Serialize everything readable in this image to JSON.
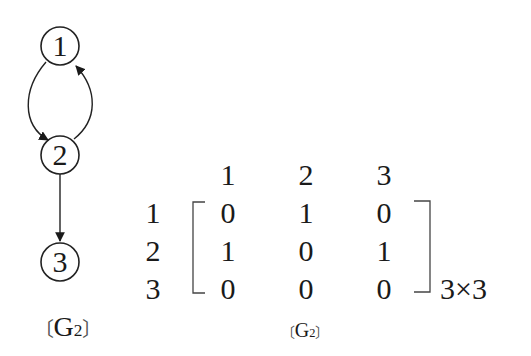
{
  "graph": {
    "name": "G2",
    "caption": {
      "open": "〔",
      "main": "G",
      "sub": "2",
      "close": "〕"
    },
    "nodes": [
      {
        "id": "1",
        "label": "1",
        "cx": 60,
        "cy": 46
      },
      {
        "id": "2",
        "label": "2",
        "cx": 60,
        "cy": 155
      },
      {
        "id": "3",
        "label": "3",
        "cx": 60,
        "cy": 262
      }
    ],
    "edges": [
      {
        "from": "1",
        "to": "2",
        "style": "curved-left"
      },
      {
        "from": "2",
        "to": "1",
        "style": "curved-right"
      },
      {
        "from": "2",
        "to": "3",
        "style": "straight"
      }
    ],
    "stroke_color": "#333333"
  },
  "matrix": {
    "col_headers": [
      "1",
      "2",
      "3"
    ],
    "row_headers": [
      "1",
      "2",
      "3"
    ],
    "rows": [
      [
        "0",
        "1",
        "0"
      ],
      [
        "1",
        "0",
        "1"
      ],
      [
        "0",
        "0",
        "0"
      ]
    ],
    "dimension": "3×3",
    "caption": {
      "open": "〔",
      "main": "G",
      "sub": "2",
      "close": "〕"
    }
  }
}
